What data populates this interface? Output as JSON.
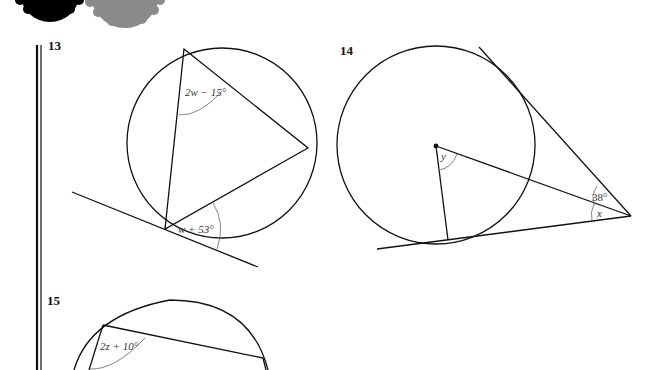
{
  "header": {
    "decoration": [
      "gear-icon-black",
      "gear-icon-grey"
    ]
  },
  "questions": [
    {
      "number": "13",
      "angle_labels": {
        "top": "2w − 15°",
        "bottom": "w + 53°"
      }
    },
    {
      "number": "14",
      "angle_labels": {
        "center": "y",
        "upper": "38°",
        "lower": "x"
      }
    },
    {
      "number": "15",
      "angle_labels": {
        "top_left": "2z + 10°"
      }
    }
  ],
  "colors": {
    "line": "#111111",
    "arc": "#666666",
    "gear_black": "#000000",
    "gear_grey": "#8a8a8a"
  }
}
